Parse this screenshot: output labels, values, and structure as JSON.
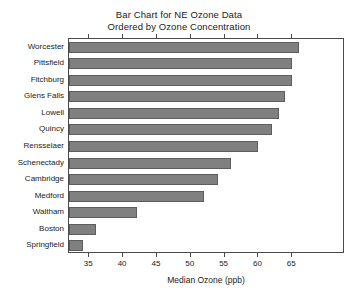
{
  "chart_data": {
    "type": "bar",
    "orientation": "horizontal",
    "title": "Bar Chart for NE Ozone Data\nOrdered by Ozone Concentration",
    "title_lines": [
      "Bar Chart for NE Ozone Data",
      "Ordered by Ozone Concentration"
    ],
    "xlabel": "Median Ozone (ppb)",
    "ylabel": "",
    "categories": [
      "Worcester",
      "Pittsfield",
      "Fitchburg",
      "Glens Falls",
      "Lowell",
      "Quincy",
      "Rensselaer",
      "Schenectady",
      "Cambridge",
      "Medford",
      "Waltham",
      "Boston",
      "Springfield"
    ],
    "values": [
      66,
      65,
      65,
      64,
      63,
      62,
      60,
      56,
      54,
      52,
      42,
      36,
      34
    ],
    "xlim": [
      32.0,
      72.8
    ],
    "xticks": [
      35,
      40,
      45,
      50,
      55,
      60,
      65
    ],
    "xtick_labels": [
      "35",
      "40",
      "45",
      "50",
      "55",
      "60",
      "65"
    ],
    "bar_base_value": 32.0,
    "grid": false,
    "legend": null,
    "bar_color": "#808080",
    "bar_edge_color": "#5d5d5d",
    "axis_color": "#4a4a4a",
    "background_color": "#ffffff"
  }
}
